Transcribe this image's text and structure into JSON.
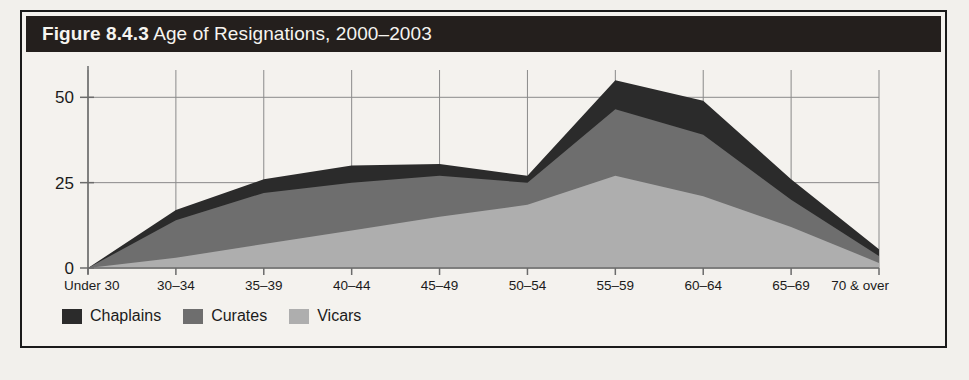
{
  "figure": {
    "number": "Figure 8.4.3",
    "caption": "Age of Resignations, 2000–2003",
    "title_full": "Figure 8.4.3 Age of Resignations, 2000–2003"
  },
  "colors": {
    "title_bar_bg": "#241f1d",
    "title_text": "#f6f4f0",
    "page_bg": "#f4f2ee",
    "frame": "#1a1a1a",
    "axis": "#6b6b6b",
    "grid": "#8a8a8a",
    "chaplains": "#2b2b2b",
    "curates": "#6e6e6e",
    "vicars": "#aeaeae"
  },
  "legend": {
    "position": "bottom-left",
    "items": [
      {
        "label": "Chaplains",
        "color": "#2b2b2b",
        "icon": "square-swatch"
      },
      {
        "label": "Curates",
        "color": "#6e6e6e",
        "icon": "square-swatch"
      },
      {
        "label": "Vicars",
        "color": "#aeaeae",
        "icon": "square-swatch"
      }
    ]
  },
  "chart_data": {
    "type": "area",
    "stacked": true,
    "title": "Figure 8.4.3 Age of Resignations, 2000–2003",
    "xlabel": "",
    "ylabel": "",
    "ylim": [
      0,
      58
    ],
    "yticks": [
      0,
      25,
      50
    ],
    "ytick_labels": [
      "0",
      "25",
      "50"
    ],
    "grid": true,
    "legend_position": "bottom-left",
    "categories": [
      "Under 30",
      "30–34",
      "35–39",
      "40–44",
      "45–49",
      "50–54",
      "55–59",
      "60–64",
      "65–69",
      "70 & over"
    ],
    "series": [
      {
        "name": "Vicars",
        "color": "#aeaeae",
        "stack_order": 1,
        "values": [
          0,
          3,
          7,
          11,
          15,
          18.5,
          27,
          21,
          12,
          1.5
        ]
      },
      {
        "name": "Curates",
        "color": "#6e6e6e",
        "stack_order": 2,
        "values": [
          0,
          11,
          15,
          14,
          12,
          6.5,
          19.5,
          18,
          8,
          2
        ]
      },
      {
        "name": "Chaplains",
        "color": "#2b2b2b",
        "stack_order": 3,
        "values": [
          0,
          3,
          4,
          5,
          3.5,
          2,
          8.5,
          10,
          6,
          2
        ]
      }
    ],
    "cumulative_totals": [
      0,
      17,
      26,
      30,
      30.5,
      27,
      55,
      49,
      26,
      5.5
    ]
  }
}
